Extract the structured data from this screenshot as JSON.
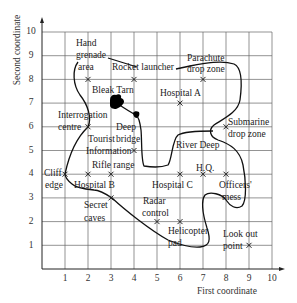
{
  "diagram": {
    "type": "coordinate-grid-map",
    "xlabel": "First coordinate",
    "ylabel": "Second coordinate",
    "x_ticks": [
      "1",
      "2",
      "3",
      "4",
      "5",
      "6",
      "7",
      "8",
      "9",
      "10"
    ],
    "y_ticks": [
      "1",
      "2",
      "3",
      "4",
      "5",
      "6",
      "7",
      "8",
      "9",
      "10"
    ],
    "xlim": [
      0,
      10
    ],
    "ylim": [
      0,
      10
    ],
    "grid": true,
    "colors": {
      "grid": "#555555",
      "line": "#111111",
      "text": "#222222"
    },
    "locations": [
      {
        "name": "Hand grenade area",
        "label_lines": [
          "Hand",
          "grenade",
          "area"
        ],
        "x": 2,
        "y": 8
      },
      {
        "name": "Rocket launcher",
        "label_lines": [
          "Rocket launcher"
        ],
        "x": 4,
        "y": 8
      },
      {
        "name": "Parachute drop zone",
        "label_lines": [
          "Parachute",
          "drop zone"
        ],
        "x": 7,
        "y": 8
      },
      {
        "name": "Bleak Tarn",
        "label_lines": [
          "Bleak Tarn"
        ],
        "x": 3,
        "y": 7
      },
      {
        "name": "Hospital A",
        "label_lines": [
          "Hospital A"
        ],
        "x": 6,
        "y": 7
      },
      {
        "name": "Interrogation centre",
        "label_lines": [
          "Interrogation",
          "centre"
        ],
        "x": 2,
        "y": 6
      },
      {
        "name": "Deep bridge",
        "label_lines": [
          "Deep",
          "bridge"
        ],
        "x": 4,
        "y": 6.5
      },
      {
        "name": "Submarine drop zone",
        "label_lines": [
          "Submarine",
          "drop zone"
        ],
        "x": 8,
        "y": 6
      },
      {
        "name": "Tourist Information",
        "label_lines": [
          "Tourist",
          "Information"
        ],
        "x": 4,
        "y": 5
      },
      {
        "name": "River Deep",
        "label_lines": [
          "River Deep"
        ],
        "x": 6,
        "y": 5
      },
      {
        "name": "Cliff edge",
        "label_lines": [
          "Cliff",
          "edge"
        ],
        "x": 1,
        "y": 4
      },
      {
        "name": "Rifle range",
        "label_lines": [
          "Rifle range"
        ],
        "x": 3,
        "y": 4
      },
      {
        "name": "Hospital B",
        "label_lines": [
          "Hospital B"
        ],
        "x": 2,
        "y": 4
      },
      {
        "name": "Hospital C",
        "label_lines": [
          "Hospital C"
        ],
        "x": 6,
        "y": 4
      },
      {
        "name": "H.Q.",
        "label_lines": [
          "H.Q."
        ],
        "x": 7,
        "y": 4
      },
      {
        "name": "Officers' mess",
        "label_lines": [
          "Officers'",
          "mess"
        ],
        "x": 8,
        "y": 4
      },
      {
        "name": "Secret caves",
        "label_lines": [
          "Secret",
          "caves"
        ],
        "x": 3,
        "y": 3
      },
      {
        "name": "Radar control",
        "label_lines": [
          "Radar",
          "control"
        ],
        "x": 5,
        "y": 2
      },
      {
        "name": "Helicopter pad",
        "label_lines": [
          "Helicopter",
          "pad"
        ],
        "x": 6,
        "y": 2
      },
      {
        "name": "Look out point",
        "label_lines": [
          "Look out",
          "point"
        ],
        "x": 9,
        "y": 1
      }
    ],
    "markers": [
      [
        2,
        8
      ],
      [
        4,
        8
      ],
      [
        7,
        8
      ],
      [
        6,
        7
      ],
      [
        2,
        6
      ],
      [
        8,
        6
      ],
      [
        4,
        5
      ],
      [
        1,
        4
      ],
      [
        2,
        4
      ],
      [
        3,
        4
      ],
      [
        6,
        4
      ],
      [
        7,
        4
      ],
      [
        8,
        4
      ],
      [
        3,
        3
      ],
      [
        5,
        2
      ],
      [
        6,
        2
      ],
      [
        9,
        1
      ]
    ]
  },
  "labels": {
    "hand": "Hand",
    "grenade": "grenade",
    "area": "area",
    "rocket": "Rocket launcher",
    "parachute": "Parachute",
    "dropzone": "drop zone",
    "bleak": "Bleak Tarn",
    "hospA": "Hospital A",
    "interrog": "Interrogation",
    "centre": "centre",
    "deep": "Deep",
    "bridge": "bridge",
    "submarine": "Submarine",
    "subdrop": "drop zone",
    "tourist": "Tourist",
    "information": "Information",
    "river": "River Deep",
    "cliff": "Cliff",
    "edge": "edge",
    "rifle": "Rifle range",
    "hospB": "Hospital B",
    "hospC": "Hospital C",
    "hq": "H.Q.",
    "officers": "Officers'",
    "mess": "mess",
    "secret": "Secret",
    "caves": "caves",
    "radar": "Radar",
    "control": "control",
    "helicopter": "Helicopter",
    "pad": "pad",
    "lookout": "Look out",
    "point": "point"
  }
}
